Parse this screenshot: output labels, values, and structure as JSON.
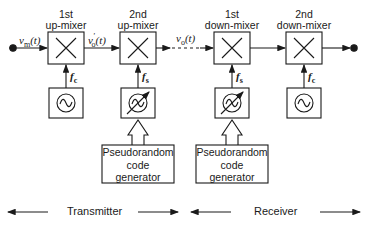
{
  "mixers": [
    {
      "line1": "1st",
      "line2": "up-mixer",
      "freq": "f",
      "freq_sub": "c",
      "tunable": false
    },
    {
      "line1": "2nd",
      "line2": "up-mixer",
      "freq": "f",
      "freq_sub": "s",
      "tunable": true
    },
    {
      "line1": "1st",
      "line2": "down-mixer",
      "freq": "f",
      "freq_sub": "s",
      "tunable": true
    },
    {
      "line1": "2nd",
      "line2": "down-mixer",
      "freq": "f",
      "freq_sub": "c",
      "tunable": false
    }
  ],
  "signals": {
    "input": {
      "base": "v",
      "sub": "m",
      "arg": "(t)"
    },
    "intermediate": {
      "base": "v",
      "prime": "'",
      "sub": "o",
      "arg": "(t)"
    },
    "output": {
      "base": "v",
      "sub": "o",
      "arg": "(t)"
    }
  },
  "generators": [
    {
      "line1": "Pseudorandom",
      "line2": "code",
      "line3": "generator"
    },
    {
      "line1": "Pseudorandom",
      "line2": "code",
      "line3": "generator"
    }
  ],
  "sections": {
    "transmitter": "Transmitter",
    "receiver": "Receiver"
  },
  "colors": {
    "stroke": "#1a1a1a",
    "background": "#ffffff"
  }
}
